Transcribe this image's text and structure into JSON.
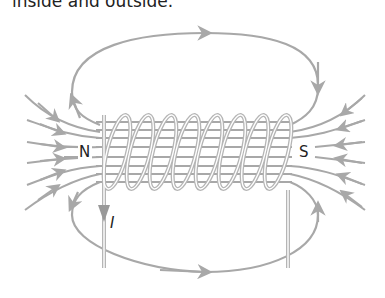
{
  "caption": "inside and outside.",
  "diagram": {
    "type": "solenoid magnetic field lines",
    "labels": {
      "north": "N",
      "south": "S",
      "current": "I"
    },
    "coil_turns": 8,
    "colors": {
      "field_line": "#a8a8a8",
      "coil": "#b5b5b5",
      "text": "#222222",
      "background": "#ffffff"
    }
  }
}
